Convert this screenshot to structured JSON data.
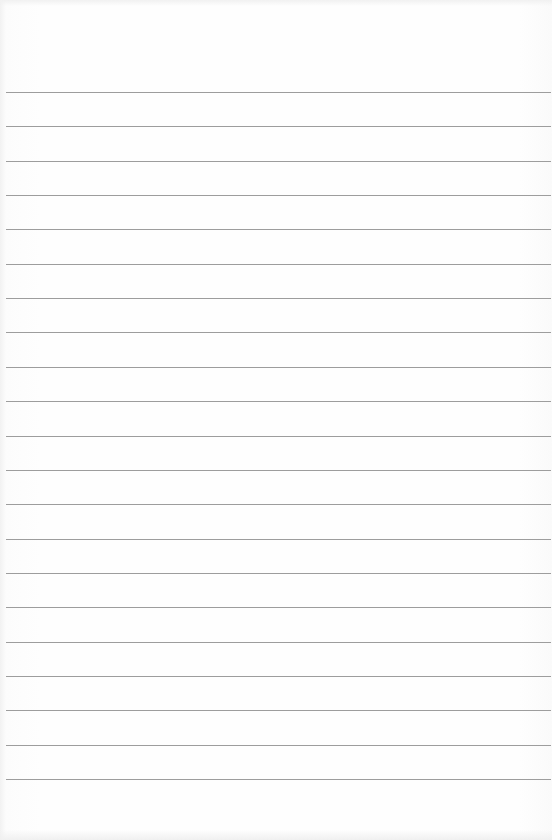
{
  "paper": {
    "type": "lined-paper",
    "background_color": "#fdfdfd",
    "line_color": "#8c8c8c",
    "line_count": 21,
    "first_line_y": 92,
    "line_spacing": 34.35,
    "line_left": 6,
    "line_right": 551
  }
}
